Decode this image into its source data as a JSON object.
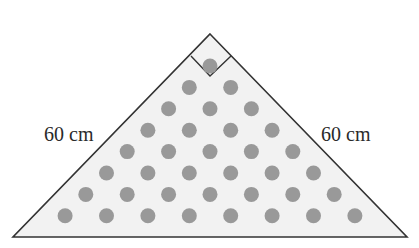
{
  "diagram": {
    "type": "right isosceles triangle with dot grid",
    "labels": {
      "left_side": "60 cm",
      "right_side": "60 cm"
    },
    "right_angle_marker": true,
    "colors": {
      "fill": "#f2f2f2",
      "stroke": "#333333",
      "dot": "#999999"
    },
    "dot_rows": [
      1,
      2,
      3,
      4,
      5,
      6,
      7,
      8
    ],
    "dot_total": 36
  }
}
